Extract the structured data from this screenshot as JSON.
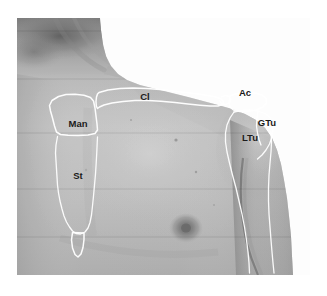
{
  "figure": {
    "modality": "grayscale photograph with white bone outline overlay",
    "background_color": "#ffffff",
    "outline_color": "#ffffff",
    "label_color": "#1b1b1b"
  },
  "photo": {
    "frame": {
      "left": 17,
      "top": 18,
      "width": 293,
      "height": 257
    },
    "skin_tone_light": "#c9c9c9",
    "skin_tone_mid": "#a8a8a8",
    "skin_tone_dark": "#7d7d7d",
    "shadow_tone": "#5e5e5e"
  },
  "labels": [
    {
      "id": "manubrium",
      "text": "Man",
      "full_name": "Manubrium of sternum",
      "x": 78,
      "y": 127
    },
    {
      "id": "sternum-body",
      "text": "St",
      "full_name": "Body of sternum",
      "x": 78,
      "y": 179
    },
    {
      "id": "clavicle",
      "text": "Cl",
      "full_name": "Clavicle",
      "x": 145,
      "y": 100
    },
    {
      "id": "acromion",
      "text": "Ac",
      "full_name": "Acromion",
      "x": 245,
      "y": 96
    },
    {
      "id": "greater-tubercle",
      "text": "GTu",
      "full_name": "Greater tubercle of humerus",
      "x": 267,
      "y": 126
    },
    {
      "id": "lesser-tubercle",
      "text": "LTu",
      "full_name": "Lesser tubercle of humerus",
      "x": 250,
      "y": 141
    }
  ],
  "outlines": [
    {
      "id": "manubrium-outline",
      "name": "manubrium-of-sternum",
      "closed": true,
      "path": "M 58.5 96.5 L 66 94.5 L 75 94.2 L 84 95.2 L 90.5 97.5 L 93.5 101 L 95 108 L 96 116 L 97 124 L 97.5 130 L 95 133.5 L 88 135 L 78 135.5 L 68 135.2 L 60.5 134.5 L 56.5 132 L 54.5 126 L 52.5 118 L 50.5 111 L 49.5 105.5 L 52 100.5 Z"
    },
    {
      "id": "sternum-body-outline",
      "name": "body-of-sternum",
      "closed": false,
      "path": "M 57.5 136.5 L 56 145 L 55.5 153 L 56 161 L 56.5 169 L 57 177 L 57.5 185 L 58.5 193 L 60 201 L 62 209 L 64 216 L 66.5 222 L 69.5 227 L 72.5 231 L 76 233.5 L 80.5 234 L 85 232 L 88 228 L 90 222.5 L 91.5 215 L 92.5 206 L 93.5 196 L 94.5 185 L 95.5 174 L 96.2 163 L 96.8 152 L 97.2 143 L 97.5 137"
    },
    {
      "id": "xiphoid-outline",
      "name": "xiphoid-process",
      "closed": true,
      "path": "M 72.5 232.5 L 71.5 240 L 72.5 248 L 75 254.5 L 78 257 L 81 254 L 83 247.5 L 84 239.5 L 84 233"
    },
    {
      "id": "clavicle-outline",
      "name": "clavicle",
      "closed": true,
      "path": "M 99 92.5 L 108 90 L 120 88.5 L 133 88 L 147 88.5 L 160 89.5 L 173 91 L 186 92.5 L 198 94 L 208 95.5 L 216 97 L 221 99 L 223.5 101.5 L 222.5 104.5 L 218 106 L 210 106 L 200 105.2 L 188 104 L 175 102.5 L 161 101.2 L 148 100.5 L 135 100.5 L 123 101.5 L 112 103 L 104 105 L 99.5 107 L 97.5 108.5 L 96.3 106 L 96 101.5 L 96.5 97 L 97.5 94"
    },
    {
      "id": "ac-joint-outline",
      "name": "acromioclavicular-joint",
      "closed": false,
      "path": "M 221 97 L 225.5 95.5 L 229.5 96.5 L 231 99.5 L 229.5 103 L 225.5 104.5 L 221.5 103.5 L 219.5 100.5"
    },
    {
      "id": "acromion-outline",
      "name": "acromion",
      "closed": true,
      "path": "M 230 96 L 237 93.5 L 246 92.5 L 255 93 L 262 95 L 266 98.5 L 266.5 103 L 263 107 L 256 110 L 248 111.5 L 240 111.5 L 233.5 110 L 230 107 L 229 102.5 Z"
    },
    {
      "id": "humeral-head-outline",
      "name": "humeral-head-with-tubercles",
      "closed": false,
      "path": "M 234 112 L 241 110.5 L 250 110 L 258 111 L 265 113.5 L 270 117.5 L 272.5 123 L 273 130 L 272 137 L 269.5 144 L 266 150 L 262 155 L 257.5 159"
    },
    {
      "id": "intertubercular-groove",
      "name": "intertubercular-groove",
      "closed": false,
      "path": "M 258 111 L 257 118 L 256.5 126 L 257.5 133 L 259 139.5 L 261 145"
    },
    {
      "id": "deltoid-anterior-border",
      "name": "humerus-medial-border",
      "closed": false,
      "path": "M 234 112 L 230 118 L 227 125 L 225.5 133 L 225.5 142 L 227 152 L 229.5 163 L 232.5 175 L 236 188 L 239 201 L 242 214 L 244.5 227 L 246.5 240 L 248 252 L 249 263 L 249.5 273"
    },
    {
      "id": "humerus-lateral-border",
      "name": "humerus-lateral-border",
      "closed": false,
      "path": "M 271 132 L 271.5 142 L 271 152 L 270 163 L 269 175 L 268.5 188 L 268.5 201 L 269 214 L 270 227 L 271 240 L 272 252 L 273 263 L 274 273"
    }
  ]
}
